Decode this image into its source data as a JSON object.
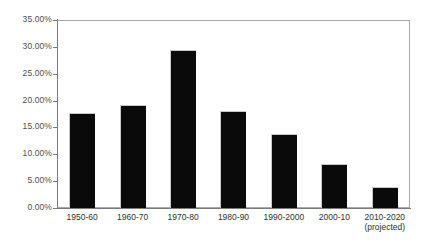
{
  "chart_data": {
    "type": "bar",
    "title": "",
    "xlabel": "",
    "ylabel": "",
    "categories": [
      "1950-60",
      "1960-70",
      "1970-80",
      "1980-90",
      "1990-2000",
      "2000-10",
      "2010-2020"
    ],
    "category_sublabels": [
      "",
      "",
      "",
      "",
      "",
      "",
      "(projected)"
    ],
    "values": [
      17.7,
      19.2,
      29.4,
      18.1,
      13.8,
      8.2,
      3.9
    ],
    "value_labels": [
      "17.70%",
      "19.20%",
      "29.40%",
      "18.10%",
      "13.80%",
      "8.20%",
      "3.90%"
    ],
    "ylim": [
      0,
      35
    ],
    "ytick_values": [
      0,
      5,
      10,
      15,
      20,
      25,
      30,
      35
    ],
    "ytick_labels": [
      "0.00%",
      "5.00%",
      "10.00%",
      "15.00%",
      "20.00%",
      "25.00%",
      "30.00%",
      "35.00%"
    ],
    "grid": false,
    "legend": false,
    "legend_position": "none",
    "bar_color": "#0a0a0a",
    "axis_color": "#7a7a7a",
    "frame_color": "#a8a8a8",
    "tick_label_color": "#4d4d4d",
    "category_label_color": "#303030",
    "background_color": "#ffffff"
  }
}
